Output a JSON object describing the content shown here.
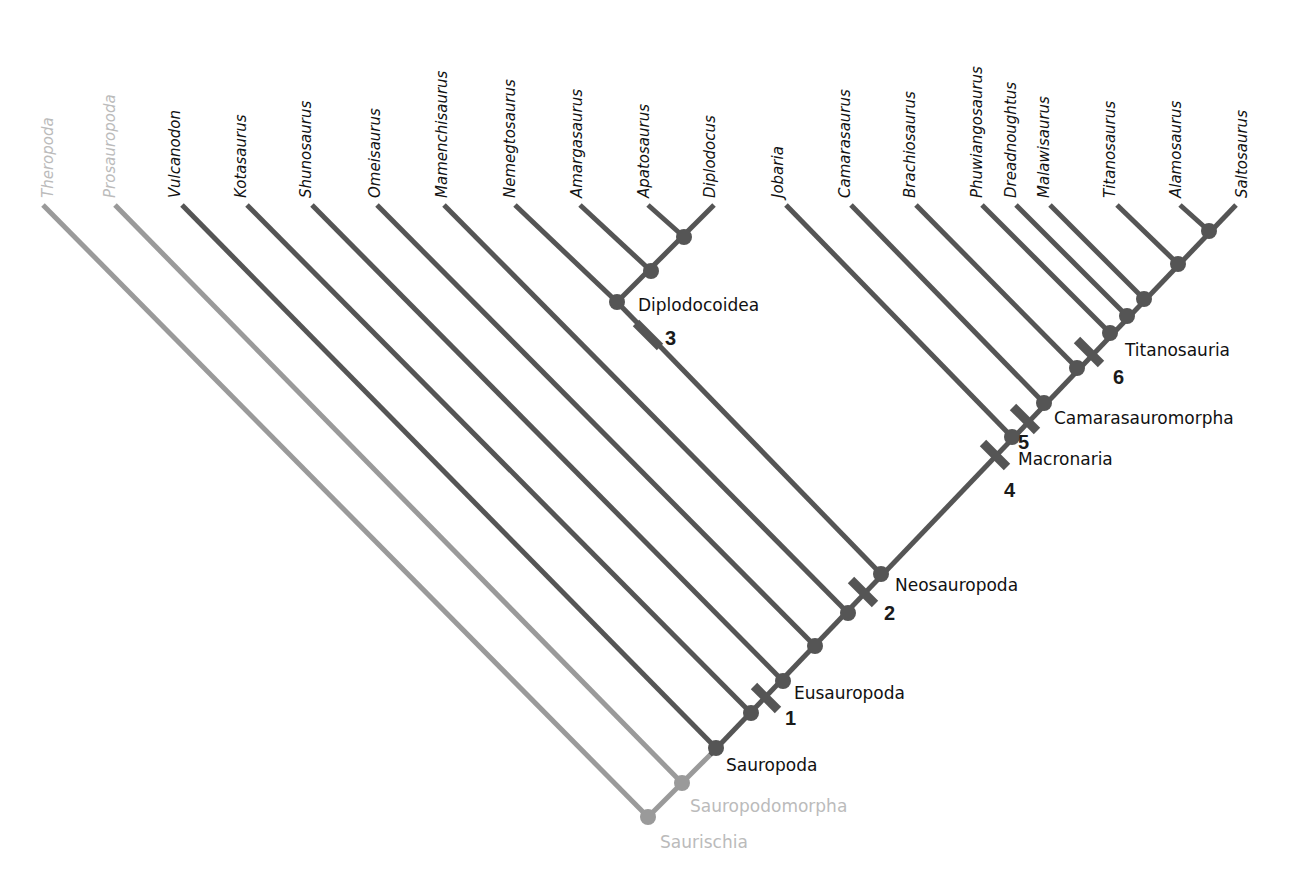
{
  "colors": {
    "branch": "#555555",
    "outgroup_branch": "#999999",
    "outgroup_text": "#bbbbbb",
    "text": "#111111"
  },
  "taxa": [
    {
      "name": "Theropoda",
      "outgroup": true
    },
    {
      "name": "Prosauropoda",
      "outgroup": true
    },
    {
      "name": "Vulcanodon",
      "outgroup": false
    },
    {
      "name": "Kotasaurus",
      "outgroup": false
    },
    {
      "name": "Shunosaurus",
      "outgroup": false
    },
    {
      "name": "Omeisaurus",
      "outgroup": false
    },
    {
      "name": "Mamenchisaurus",
      "outgroup": false
    },
    {
      "name": "Nemegtosaurus",
      "outgroup": false
    },
    {
      "name": "Amargasaurus",
      "outgroup": false
    },
    {
      "name": "Apatosaurus",
      "outgroup": false
    },
    {
      "name": "Diplodocus",
      "outgroup": false
    },
    {
      "name": "Jobaria",
      "outgroup": false
    },
    {
      "name": "Camarasaurus",
      "outgroup": false
    },
    {
      "name": "Brachiosaurus",
      "outgroup": false
    },
    {
      "name": "Phuwiangosaurus",
      "outgroup": false
    },
    {
      "name": "Dreadnoughtus",
      "outgroup": false
    },
    {
      "name": "Malawisaurus",
      "outgroup": false
    },
    {
      "name": "Titanosaurus",
      "outgroup": false
    },
    {
      "name": "Alamosaurus",
      "outgroup": false
    },
    {
      "name": "Saltosaurus",
      "outgroup": false
    }
  ],
  "clades": [
    {
      "name": "Saurischia",
      "outgroup": true
    },
    {
      "name": "Sauropodomorpha",
      "outgroup": true
    },
    {
      "name": "Sauropoda",
      "outgroup": false
    },
    {
      "name": "Eusauropoda",
      "outgroup": false
    },
    {
      "name": "Neosauropoda",
      "outgroup": false
    },
    {
      "name": "Diplodocoidea",
      "outgroup": false
    },
    {
      "name": "Macronaria",
      "outgroup": false
    },
    {
      "name": "Camarasauromorpha",
      "outgroup": false
    },
    {
      "name": "Titanosauria",
      "outgroup": false
    }
  ],
  "character_marks": [
    "1",
    "2",
    "3",
    "4",
    "5",
    "6"
  ],
  "caption_fragment": "…"
}
